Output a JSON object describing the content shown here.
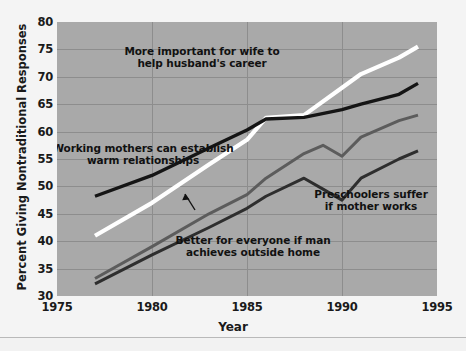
{
  "chart_data": {
    "type": "line",
    "title": "",
    "xlabel": "Year",
    "ylabel": "Percent Giving Nontraditional Responses",
    "xlim": [
      1975,
      1995
    ],
    "ylim": [
      30,
      80
    ],
    "xticks": [
      1975,
      1980,
      1985,
      1990,
      1995
    ],
    "yticks": [
      30,
      35,
      40,
      45,
      50,
      55,
      60,
      65,
      70,
      75,
      80
    ],
    "grid": "both",
    "legend": "annotations-inline",
    "background": "#a9a9a9",
    "series": [
      {
        "name": "More important for wife to help husband's career",
        "color": "#ffffff",
        "x": [
          1977,
          1980,
          1983,
          1985,
          1986,
          1988,
          1990,
          1991,
          1993,
          1994
        ],
        "y": [
          41.0,
          47.0,
          54.0,
          58.5,
          62.5,
          63.0,
          68.0,
          70.5,
          73.5,
          75.5
        ]
      },
      {
        "name": "Working mothers can establish warm relationships",
        "color": "#151515",
        "x": [
          1977,
          1980,
          1983,
          1985,
          1986,
          1988,
          1990,
          1991,
          1993,
          1994
        ],
        "y": [
          48.2,
          52.0,
          57.0,
          60.3,
          62.3,
          62.6,
          64.0,
          65.0,
          66.8,
          68.8
        ]
      },
      {
        "name": "Better for everyone if man achieves outside home",
        "color": "#5c5c5c",
        "x": [
          1977,
          1980,
          1983,
          1985,
          1986,
          1988,
          1989,
          1990,
          1991,
          1993,
          1994
        ],
        "y": [
          33.2,
          39.0,
          45.0,
          48.5,
          51.5,
          56.0,
          57.5,
          55.5,
          59.0,
          62.0,
          63.0
        ]
      },
      {
        "name": "Preschoolers suffer if mother works",
        "color": "#2e2e2e",
        "x": [
          1977,
          1980,
          1983,
          1985,
          1986,
          1988,
          1989,
          1990,
          1991,
          1993,
          1994
        ],
        "y": [
          32.2,
          37.5,
          42.5,
          46.0,
          48.2,
          51.5,
          49.5,
          47.5,
          51.5,
          55.0,
          56.5
        ]
      }
    ],
    "annotations": [
      {
        "id": "annot-white",
        "lines": [
          "More important for wife to",
          "help husband's career"
        ],
        "x": 300,
        "y": 52
      },
      {
        "id": "annot-black",
        "lines": [
          "Working mothers can establish",
          "warm relationships"
        ],
        "x": 140,
        "y": 148
      },
      {
        "id": "annot-gray",
        "lines": [
          "Better for everyone if man",
          "achieves outside home"
        ],
        "x": 250,
        "y": 242
      },
      {
        "id": "annot-dark",
        "lines": [
          "Preschoolers suffer",
          "if mother works"
        ],
        "x": 365,
        "y": 192
      }
    ]
  }
}
